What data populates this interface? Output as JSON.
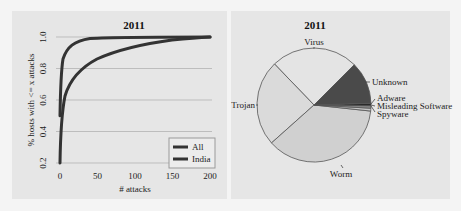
{
  "chart_data": [
    {
      "type": "line",
      "title": "2011",
      "xlabel": "# attacks",
      "ylabel": "% hosts with <= x attacks",
      "xlim": [
        0,
        200
      ],
      "ylim": [
        0.2,
        1.0
      ],
      "xticks": [
        "0",
        "50",
        "100",
        "150",
        "200"
      ],
      "yticks": [
        "0.2",
        "0.4",
        "0.6",
        "0.8",
        "1.0"
      ],
      "grid": "horizontal",
      "legend_position": "lower right",
      "series": [
        {
          "name": "All",
          "x": [
            0,
            2,
            5,
            10,
            20,
            30,
            50,
            75,
            100,
            150,
            200
          ],
          "y": [
            0.5,
            0.72,
            0.83,
            0.9,
            0.95,
            0.97,
            0.985,
            0.99,
            0.995,
            0.998,
            1.0
          ]
        },
        {
          "name": "India",
          "x": [
            0,
            2,
            5,
            10,
            20,
            30,
            50,
            75,
            100,
            150,
            200
          ],
          "y": [
            0.2,
            0.45,
            0.6,
            0.7,
            0.8,
            0.85,
            0.9,
            0.93,
            0.955,
            0.985,
            1.0
          ]
        }
      ]
    },
    {
      "type": "pie",
      "title": "2011",
      "slices": [
        {
          "label": "Virus",
          "value": 24.7
        },
        {
          "label": "Trojan",
          "value": 24.4
        },
        {
          "label": "Worm",
          "value": 36.7
        },
        {
          "label": "Spyware",
          "value": 0.8
        },
        {
          "label": "Misleading Software",
          "value": 0.7
        },
        {
          "label": "Adware",
          "value": 0.7
        },
        {
          "label": "Unknown",
          "value": 12.0
        }
      ]
    }
  ],
  "left": {
    "title": "2011",
    "xlabel": "# attacks",
    "ylabel": "% hosts with <= x attacks",
    "xticks": [
      "0",
      "50",
      "100",
      "150",
      "200"
    ],
    "yticks": [
      "0.2",
      "0.4",
      "0.6",
      "0.8",
      "1.0"
    ],
    "legend": [
      "All",
      "India"
    ]
  },
  "right": {
    "title": "2011",
    "labels": {
      "virus": "Virus",
      "trojan": "Trojan",
      "worm": "Worm",
      "unknown": "Unknown",
      "adware": "Adware",
      "misleading": "Misleading Software",
      "spyware": "Spyware"
    }
  },
  "colors": {
    "panel_bg": "#e6e6e6",
    "page_bg": "#f4f4f4",
    "line": "#333333",
    "grid": "#bdbdbd",
    "virus": "#e4e4e4",
    "trojan": "#dadada",
    "worm": "#d0d0d0",
    "unknown": "#4a4a4a",
    "adware": "#2a2a2a",
    "misleading": "#8a8a8a",
    "spyware": "#c4c4c4"
  }
}
